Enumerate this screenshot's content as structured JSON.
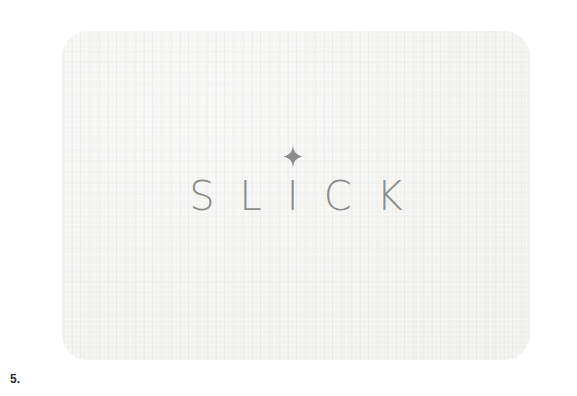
{
  "figure": {
    "caption": "5.",
    "background_color": "#ffffff"
  },
  "card": {
    "name": "logo-card",
    "background_color": "#f2f2f0",
    "corner_radius": "26px",
    "texture": "subtle-woven-paper"
  },
  "logo": {
    "wordmark": "SLICK",
    "letters": [
      "S",
      "L",
      "I",
      "C",
      "K"
    ],
    "letter_color": "#8c8c8c",
    "accent_icon": "sparkle-icon",
    "accent_icon_color": "#8c8c8c",
    "accent_over_letter": "I"
  }
}
